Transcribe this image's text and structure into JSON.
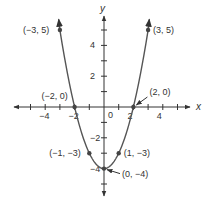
{
  "chart_data": {
    "type": "line",
    "title": "",
    "xlabel": "x",
    "ylabel": "y",
    "xlim": [
      -6,
      6
    ],
    "ylim": [
      -6,
      6
    ],
    "grid": false,
    "function": "y = x^2 - 4",
    "x_ticks": [
      -5,
      -4,
      -3,
      -2,
      -1,
      1,
      2,
      3,
      4,
      5
    ],
    "x_tick_labels": [
      {
        "x": -4,
        "label": "−4"
      },
      {
        "x": -2,
        "label": "−2"
      },
      {
        "x": 2,
        "label": "2"
      },
      {
        "x": 4,
        "label": "4"
      }
    ],
    "y_ticks": [
      -5,
      -4,
      -3,
      -2,
      -1,
      1,
      2,
      3,
      4,
      5
    ],
    "y_tick_labels": [
      {
        "y": 4,
        "label": "4"
      },
      {
        "y": 2,
        "label": "2"
      },
      {
        "y": -2,
        "label": "−2"
      },
      {
        "y": -4,
        "label": "−4"
      }
    ],
    "origin_label": "0",
    "series": [
      {
        "name": "parabola",
        "x": [
          -3.1,
          -3,
          -2.5,
          -2,
          -1.5,
          -1,
          -0.5,
          0,
          0.5,
          1,
          1.5,
          2,
          2.5,
          3,
          3.1
        ],
        "y": [
          5.61,
          5,
          2.25,
          0,
          -1.75,
          -3,
          -3.75,
          -4,
          -3.75,
          -3,
          -1.75,
          0,
          2.25,
          5,
          5.61
        ]
      }
    ],
    "points": [
      {
        "x": -3,
        "y": 5,
        "label": "(−3, 5)"
      },
      {
        "x": 3,
        "y": 5,
        "label": "(3, 5)"
      },
      {
        "x": -2,
        "y": 0,
        "label": "(−2, 0)"
      },
      {
        "x": 2,
        "y": 0,
        "label": "(2, 0)"
      },
      {
        "x": -1,
        "y": -3,
        "label": "(−1, −3)"
      },
      {
        "x": 1,
        "y": -3,
        "label": "(1, −3)"
      },
      {
        "x": 0,
        "y": -4,
        "label": "(0, −4)"
      }
    ]
  },
  "colors": {
    "axis": "#333333",
    "curve": "#555555",
    "point": "#444444"
  }
}
